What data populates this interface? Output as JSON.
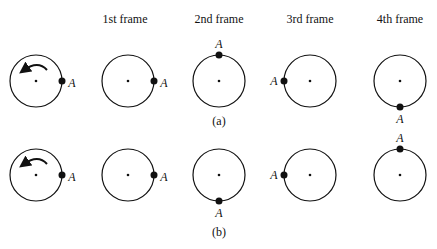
{
  "headers": [
    "1st frame",
    "2nd frame",
    "3rd frame",
    "4th frame"
  ],
  "point_label": "A",
  "rows": [
    {
      "caption": "(a)",
      "rotation": "counterclockwise",
      "positions": [
        "right",
        "right",
        "top",
        "left",
        "bottom"
      ]
    },
    {
      "caption": "(b)",
      "rotation": "counterclockwise",
      "positions": [
        "right",
        "right",
        "bottom",
        "left",
        "top"
      ]
    }
  ]
}
